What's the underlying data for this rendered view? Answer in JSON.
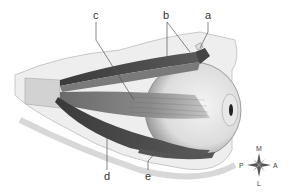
{
  "diagram": {
    "labels": [
      {
        "id": "a",
        "text": "a"
      },
      {
        "id": "b",
        "text": "b"
      },
      {
        "id": "c",
        "text": "c"
      },
      {
        "id": "d",
        "text": "d"
      },
      {
        "id": "e",
        "text": "e"
      }
    ],
    "compass": {
      "top": "M",
      "right": "A",
      "bottom": "L",
      "left": "P"
    }
  }
}
